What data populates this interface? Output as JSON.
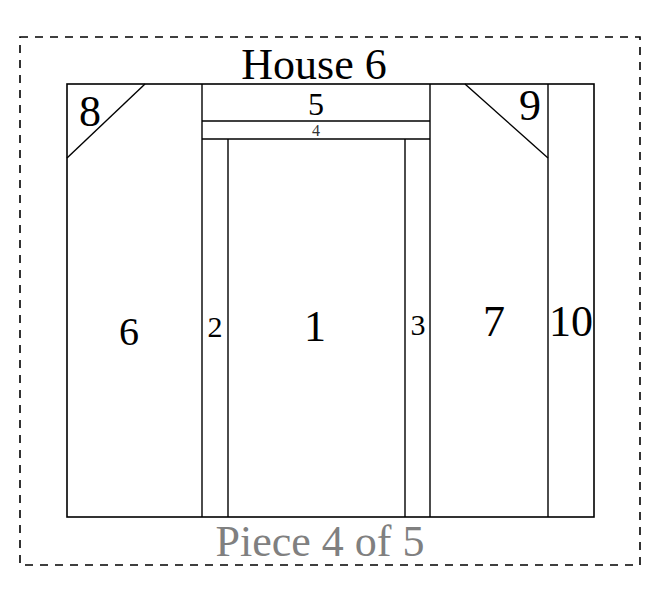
{
  "title": "House 6",
  "footer": "Piece 4 of 5",
  "colors": {
    "line": "#000000",
    "footer_text": "#808080",
    "background": "#ffffff"
  },
  "pieces": [
    {
      "id": "1",
      "label": "1"
    },
    {
      "id": "2",
      "label": "2"
    },
    {
      "id": "3",
      "label": "3"
    },
    {
      "id": "4",
      "label": "4"
    },
    {
      "id": "5",
      "label": "5"
    },
    {
      "id": "6",
      "label": "6"
    },
    {
      "id": "7",
      "label": "7"
    },
    {
      "id": "8",
      "label": "8"
    },
    {
      "id": "9",
      "label": "9"
    },
    {
      "id": "10",
      "label": "10"
    }
  ]
}
